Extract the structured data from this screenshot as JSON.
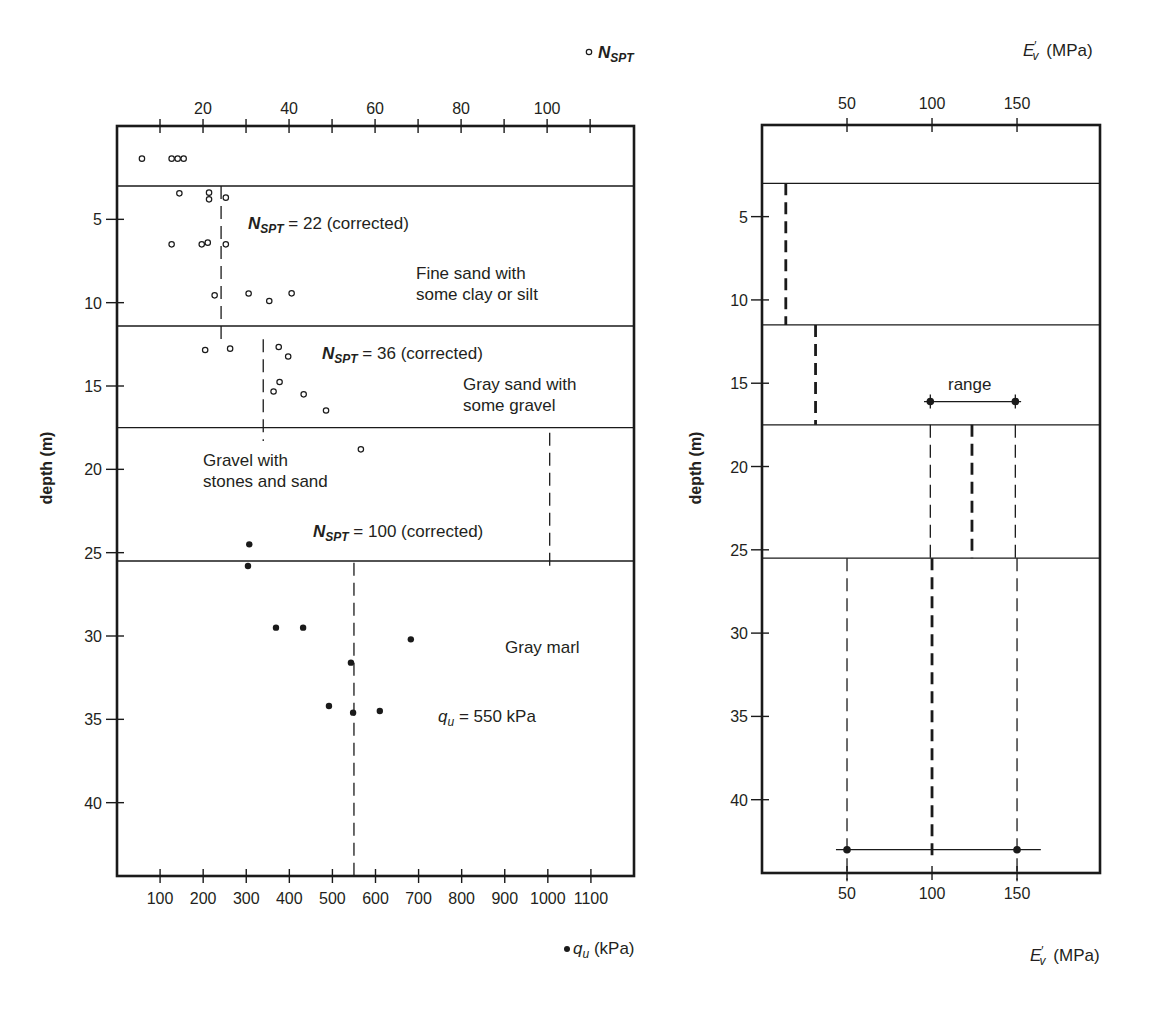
{
  "chart_data": [
    {
      "type": "scatter",
      "title": "",
      "ylabel": "depth (m)",
      "ylim": [
        -0.6,
        44.4
      ],
      "y_inverted": true,
      "yticks": [
        5,
        10,
        15,
        20,
        25,
        30,
        35,
        40
      ],
      "grid": false,
      "x_top": {
        "label": {
          "marker": "∘",
          "main": "N",
          "sub": "SPT"
        },
        "range": [
          0,
          120.2
        ],
        "ticks": [
          10,
          20,
          30,
          40,
          50,
          60,
          70,
          80,
          90,
          100,
          110
        ],
        "tick_labels": [
          "20",
          "40",
          "60",
          "80",
          "100"
        ],
        "tick_label_values": [
          20,
          40,
          60,
          80,
          100
        ]
      },
      "x_bottom": {
        "label": {
          "marker": "•",
          "main": "q",
          "sub": "u",
          "rest": " (kPa)"
        },
        "range": [
          0,
          1200
        ],
        "ticks": [
          100,
          200,
          300,
          400,
          500,
          600,
          700,
          800,
          900,
          1000,
          1100
        ],
        "tick_labels": [
          "100",
          "200",
          "300",
          "400",
          "500",
          "600",
          "700",
          "800",
          "900",
          "1000",
          "1100"
        ],
        "tick_label_values": [
          100,
          200,
          300,
          400,
          500,
          600,
          700,
          800,
          900,
          1000,
          1100
        ]
      },
      "layer_boundaries": [
        3.0,
        11.4,
        17.5,
        25.5
      ],
      "series": [
        {
          "name": "N_SPT",
          "axis": "x_top",
          "marker": "open-circle",
          "points": [
            [
              5.8,
              1.36
            ],
            [
              12.7,
              1.36
            ],
            [
              14.1,
              1.36
            ],
            [
              15.5,
              1.36
            ],
            [
              14.5,
              3.44
            ],
            [
              21.4,
              3.4
            ],
            [
              21.4,
              3.8
            ],
            [
              25.3,
              3.7
            ],
            [
              12.7,
              6.5
            ],
            [
              19.7,
              6.5
            ],
            [
              21.1,
              6.4
            ],
            [
              25.3,
              6.5
            ],
            [
              22.7,
              9.56
            ],
            [
              30.6,
              9.45
            ],
            [
              35.4,
              9.9
            ],
            [
              40.6,
              9.44
            ],
            [
              20.5,
              12.84
            ],
            [
              26.3,
              12.76
            ],
            [
              37.6,
              12.66
            ],
            [
              39.8,
              13.23
            ],
            [
              37.8,
              14.76
            ],
            [
              36.4,
              15.33
            ],
            [
              43.4,
              15.5
            ],
            [
              48.6,
              16.47
            ],
            [
              56.7,
              18.8
            ]
          ]
        },
        {
          "name": "q_u (kPa)",
          "axis": "x_bottom",
          "marker": "filled-circle",
          "points": [
            [
              307,
              24.5
            ],
            [
              304,
              25.8
            ],
            [
              369,
              29.5
            ],
            [
              432,
              29.5
            ],
            [
              682,
              30.2
            ],
            [
              543,
              31.6
            ],
            [
              492,
              34.2
            ],
            [
              548,
              34.6
            ],
            [
              610,
              34.5
            ]
          ]
        }
      ],
      "design_lines": [
        {
          "axis": "x_top",
          "x": 24.2,
          "depth_from": 3.0,
          "depth_to": 12.3,
          "style": "thin",
          "value_label": "N_SPT = 22 (corrected)"
        },
        {
          "axis": "x_top",
          "x": 34.0,
          "depth_from": 12.2,
          "depth_to": 18.3,
          "style": "thin",
          "value_label": "N_SPT = 36 (corrected)"
        },
        {
          "axis": "x_top",
          "x": 100.6,
          "depth_from": 17.8,
          "depth_to": 25.8,
          "style": "thin",
          "value_label": "N_SPT = 100 (corrected)"
        },
        {
          "axis": "x_bottom",
          "x": 550,
          "depth_from": 25.6,
          "depth_to": 44.4,
          "style": "thin",
          "value_label": "q_u = 550 kPa"
        }
      ],
      "annotations": [
        {
          "main": "N",
          "sub": "SPT",
          "rest": " = 22 (corrected)"
        },
        {
          "text": "Fine sand with"
        },
        {
          "text": "some clay or silt"
        },
        {
          "main": "N",
          "sub": "SPT",
          "rest": " = 36 (corrected)"
        },
        {
          "text": "Gray sand with"
        },
        {
          "text": "some gravel"
        },
        {
          "text": "Gravel with"
        },
        {
          "text": "stones and sand"
        },
        {
          "main": "N",
          "sub": "SPT",
          "rest": " = 100 (corrected)"
        },
        {
          "text": "Gray marl"
        },
        {
          "main": "q",
          "sub": "u",
          "rest": " = 550 kPa"
        }
      ]
    },
    {
      "type": "line",
      "title": "",
      "ylabel": "depth (m)",
      "ylim": [
        -0.5,
        44.4
      ],
      "y_inverted": true,
      "yticks": [
        5,
        10,
        15,
        20,
        25,
        30,
        35,
        40
      ],
      "grid": false,
      "x_top": {
        "label": {
          "main": "E",
          "prime": "′",
          "sub": "v",
          "rest": " (MPa)"
        },
        "range": [
          0,
          198.8
        ],
        "ticks": [
          50,
          100,
          150
        ],
        "tick_labels": [
          "50",
          "100",
          "150"
        ],
        "tick_label_values": [
          50,
          100,
          150
        ]
      },
      "x_bottom": {
        "label": {
          "main": "E",
          "prime": "′",
          "sub": "v",
          "rest": " (MPa)"
        },
        "range": [
          0,
          198.8
        ],
        "ticks": [
          50,
          100,
          150
        ],
        "tick_labels": [
          "50",
          "100",
          "150"
        ],
        "tick_label_values": [
          50,
          100,
          150
        ]
      },
      "layer_boundaries": [
        3.0,
        11.5,
        17.5,
        25.5
      ],
      "design_lines": [
        {
          "axis": "x_top",
          "x": 14.0,
          "depth_from": 3.0,
          "depth_to": 11.5,
          "style": "thick"
        },
        {
          "axis": "x_top",
          "x": 31.5,
          "depth_from": 11.5,
          "depth_to": 17.5,
          "style": "thick"
        },
        {
          "axis": "x_top",
          "x": 99.0,
          "depth_from": 17.5,
          "depth_to": 25.5,
          "style": "thin"
        },
        {
          "axis": "x_top",
          "x": 123.5,
          "depth_from": 17.5,
          "depth_to": 25.5,
          "style": "thick"
        },
        {
          "axis": "x_top",
          "x": 149.0,
          "depth_from": 17.5,
          "depth_to": 25.5,
          "style": "thin"
        },
        {
          "axis": "x_top",
          "x": 50.0,
          "depth_from": 25.5,
          "depth_to": 44.9,
          "style": "thin"
        },
        {
          "axis": "x_top",
          "x": 100.0,
          "depth_from": 25.5,
          "depth_to": 43.6,
          "style": "thick"
        },
        {
          "axis": "x_top",
          "x": 150.0,
          "depth_from": 25.5,
          "depth_to": 44.9,
          "style": "thin"
        }
      ],
      "range_bars": [
        {
          "depth": 16.1,
          "x_from": 95.3,
          "x_to": 152.4,
          "points": [
            99,
            149
          ],
          "crossed": true
        },
        {
          "depth": 43.0,
          "x_from": 43.5,
          "x_to": 164.0,
          "points": [
            50,
            150
          ],
          "crossed": false
        }
      ],
      "annotations": [
        {
          "text": "range"
        }
      ]
    }
  ]
}
